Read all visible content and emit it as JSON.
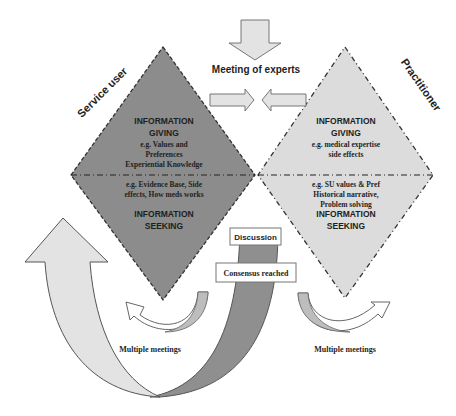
{
  "diagram": {
    "title_top": "Meeting of experts",
    "labels": {
      "left_role": "Service user",
      "right_role": "Practitioner"
    },
    "left_diamond": {
      "fill": "#8c8c8c",
      "giving_heading_1": "INFORMATION",
      "giving_heading_2": "GIVING",
      "giving_lines": [
        "e.g. Values and",
        "Preferences",
        "Experiential Knowledge"
      ],
      "seeking_lines": [
        "e.g. Evidence Base, Side",
        "effects, How meds works"
      ],
      "seeking_heading_1": "INFORMATION",
      "seeking_heading_2": "SEEKING"
    },
    "right_diamond": {
      "fill": "#dcdcdc",
      "giving_heading_1": "INFORMATION",
      "giving_heading_2": "GIVING",
      "giving_lines": [
        "e.g. medical expertise",
        "side effects"
      ],
      "seeking_lines": [
        "e.g. SU values & Pref",
        "Historical narrative,",
        "Problem solving"
      ],
      "seeking_heading_1": "INFORMATION",
      "seeking_heading_2": "SEEKING"
    },
    "boxes": {
      "discussion": "Discussion",
      "consensus": "Consensus reached"
    },
    "loops": {
      "left_label": "Multiple meetings",
      "right_label": "Multiple meetings"
    },
    "colors": {
      "dark_gray": "#8c8c8c",
      "light_gray": "#dcdcdc",
      "arrow_light": "#e3e3e3",
      "arrow_dark": "#8f8f8f",
      "outline": "#555555"
    }
  }
}
